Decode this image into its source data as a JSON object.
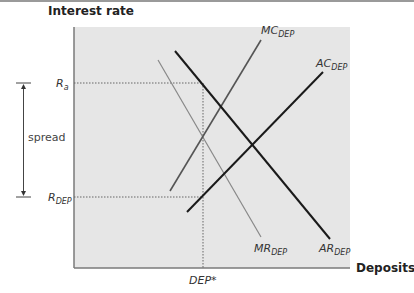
{
  "diagram": {
    "y_axis_label": "Interest rate",
    "x_axis_label": "Deposits",
    "y_levels": [
      {
        "id": "Ra",
        "label_main": "R",
        "label_sub": "a"
      },
      {
        "id": "RDEP",
        "label_main": "R",
        "label_sub": "DEP"
      }
    ],
    "x_levels": [
      {
        "id": "DEPstar",
        "label": "DEP*"
      }
    ],
    "spread_label": "spread",
    "curves": [
      {
        "id": "MC",
        "label_main": "MC",
        "label_sub": "DEP",
        "color": "#555555"
      },
      {
        "id": "AC",
        "label_main": "AC",
        "label_sub": "DEP",
        "color": "#1a1a1a"
      },
      {
        "id": "AR",
        "label_main": "AR",
        "label_sub": "DEP",
        "color": "#1a1a1a"
      },
      {
        "id": "MR",
        "label_main": "MR",
        "label_sub": "DEP",
        "color": "#888888"
      }
    ],
    "colors": {
      "plot_background": "#e6e6e6",
      "axis": "#7a7a7a",
      "guide": "#666666"
    }
  }
}
